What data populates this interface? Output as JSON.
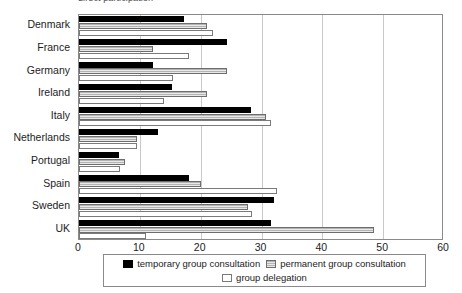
{
  "chart_data": {
    "type": "bar",
    "orientation": "horizontal",
    "title": "direct participation",
    "xlabel": "",
    "ylabel": "",
    "xlim": [
      0,
      60
    ],
    "xticks": [
      0,
      10,
      20,
      30,
      40,
      50,
      60
    ],
    "grid": true,
    "legend_position": "bottom",
    "categories": [
      "Denmark",
      "France",
      "Germany",
      "Ireland",
      "Italy",
      "Netherlands",
      "Portugal",
      "Spain",
      "Sweden",
      "UK"
    ],
    "series": [
      {
        "name": "temporary group consultation",
        "color": "#000000",
        "values": [
          17.3,
          24.3,
          12.2,
          15.3,
          28.3,
          13.0,
          6.5,
          18.0,
          32.0,
          31.5
        ]
      },
      {
        "name": "permanent group consultation",
        "color": "#d2d2d2",
        "values": [
          21.0,
          12.2,
          24.3,
          21.0,
          30.8,
          9.5,
          7.5,
          20.0,
          27.8,
          48.5
        ]
      },
      {
        "name": "group delegation",
        "color": "#ffffff",
        "values": [
          22.0,
          18.0,
          15.5,
          14.0,
          31.6,
          9.5,
          6.8,
          32.5,
          28.5,
          11.0
        ]
      }
    ]
  },
  "legend": {
    "items": [
      {
        "label": "temporary group consultation",
        "swatch": "sw-temp"
      },
      {
        "label": "permanent group consultation",
        "swatch": "sw-perm"
      },
      {
        "label": "group delegation",
        "swatch": "sw-deleg"
      }
    ]
  }
}
